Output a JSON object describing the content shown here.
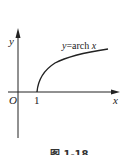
{
  "figure": {
    "curve_label_prefix": "y=arch ",
    "curve_label_var": "x",
    "origin_label": "O",
    "x_axis_label": "x",
    "y_axis_label": "y",
    "x_tick_label": "1",
    "caption": "图 1-18"
  },
  "colors": {
    "ink": "#222222",
    "background": "#ffffff"
  }
}
